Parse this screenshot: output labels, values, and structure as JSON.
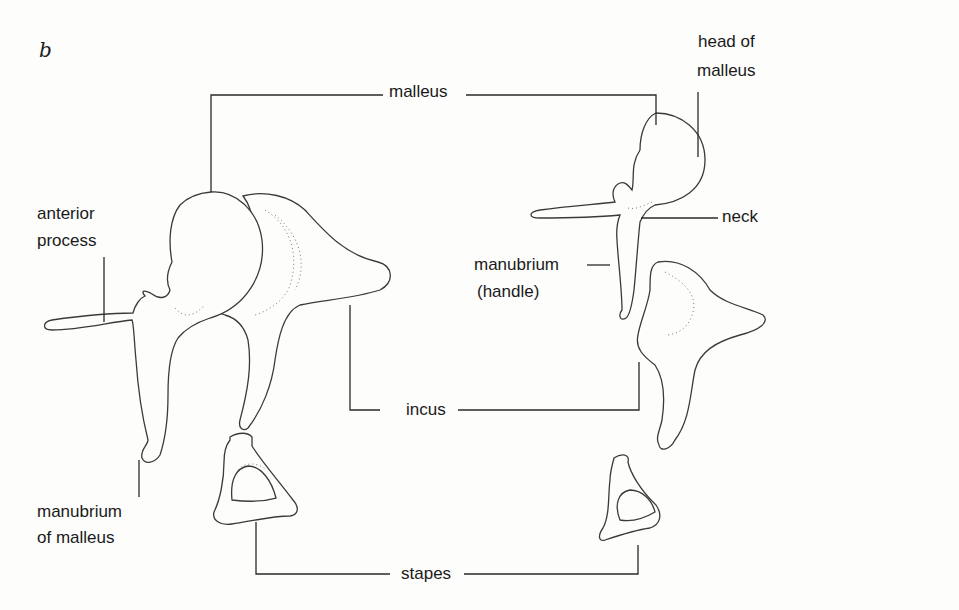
{
  "figure": {
    "panel_label": "b",
    "labels": {
      "malleus": "malleus",
      "incus": "incus",
      "stapes": "stapes",
      "head_of_malleus_line1": "head of",
      "head_of_malleus_line2": "malleus",
      "neck": "neck",
      "manubrium_handle_line1": "manubrium",
      "manubrium_handle_line2": "(handle)",
      "anterior_process_line1": "anterior",
      "anterior_process_line2": "process",
      "manubrium_of_malleus_line1": "manubrium",
      "manubrium_of_malleus_line2": "of malleus"
    }
  }
}
